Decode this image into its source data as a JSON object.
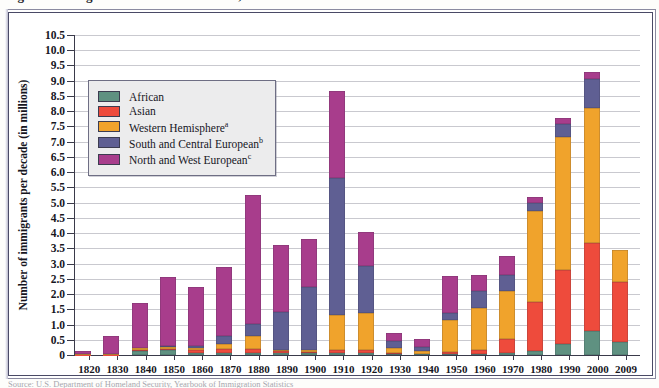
{
  "figure": {
    "caption_cut": "Figure 1  Immigration to the United States, 1820–2009",
    "footnote_cut": "Source: U.S. Department of Homeland Security, Yearbook of Immigration Statistics"
  },
  "chart_data": {
    "type": "bar",
    "stacked": true,
    "title": "",
    "xlabel": "",
    "ylabel": "Number of immigrants per decade (in millions)",
    "ylim": [
      0,
      10.5
    ],
    "ytick_step": 0.5,
    "ytick_labels": [
      "0",
      "0.5",
      "1.0",
      "1.5",
      "2.0",
      "2.5",
      "3.0",
      "3.5",
      "4.0",
      "4.5",
      "5.0",
      "5.5",
      "6.0",
      "6.5",
      "7.0",
      "7.5",
      "8.0",
      "8.5",
      "9.0",
      "9.5",
      "10.0",
      "10.5"
    ],
    "grid": true,
    "legend_position": "upper-left-inside",
    "categories": [
      "1820",
      "1830",
      "1840",
      "1850",
      "1860",
      "1870",
      "1880",
      "1890",
      "1900",
      "1910",
      "1920",
      "1930",
      "1940",
      "1950",
      "1960",
      "1970",
      "1980",
      "1990",
      "2000",
      "2009"
    ],
    "series": [
      {
        "name": "African",
        "color": "#5f9181",
        "values": [
          0.0,
          0.0,
          0.13,
          0.15,
          0.08,
          0.07,
          0.06,
          0.05,
          0.05,
          0.05,
          0.05,
          0.02,
          0.02,
          0.03,
          0.04,
          0.08,
          0.14,
          0.36,
          0.8,
          0.42
        ]
      },
      {
        "name": "Asian",
        "color": "#ee4b3c",
        "values": [
          0.01,
          0.01,
          0.02,
          0.04,
          0.07,
          0.12,
          0.13,
          0.07,
          0.06,
          0.11,
          0.11,
          0.03,
          0.02,
          0.06,
          0.14,
          0.43,
          1.59,
          2.44,
          2.86,
          1.99
        ]
      },
      {
        "name": "Western Hemisphere",
        "color": "#f0a32c",
        "values": [
          0.01,
          0.01,
          0.07,
          0.07,
          0.08,
          0.17,
          0.42,
          0.04,
          0.04,
          1.14,
          1.22,
          0.19,
          0.09,
          1.06,
          1.35,
          1.58,
          2.98,
          4.37,
          4.44,
          1.03
        ]
      },
      {
        "name": "South and Central European",
        "color": "#5f5f93",
        "values": [
          0.0,
          0.01,
          0.02,
          0.05,
          0.08,
          0.25,
          0.4,
          1.25,
          2.08,
          4.5,
          1.55,
          0.22,
          0.12,
          0.22,
          0.57,
          0.53,
          0.29,
          0.4,
          0.97,
          0.0
        ]
      },
      {
        "name": "North and West European",
        "color": "#a83d8c",
        "values": [
          0.1,
          0.58,
          1.48,
          2.24,
          1.92,
          2.29,
          4.23,
          2.19,
          1.58,
          2.88,
          1.12,
          0.25,
          0.28,
          1.23,
          0.54,
          0.63,
          0.19,
          0.22,
          0.21,
          0.0
        ]
      }
    ],
    "totals": [
      "0.13",
      "0.61",
      "1.71",
      "2.55",
      "2.21",
      "2.89",
      "5.25",
      "3.61",
      "8.80",
      "5.74",
      "4.11",
      "0.53",
      "1.03",
      "2.60",
      "3.21",
      "4.25",
      "7.34",
      "9.08",
      "10.30",
      "3.44"
    ],
    "legend_entries": [
      {
        "label": "African",
        "superscript": "",
        "color": "#5f9181"
      },
      {
        "label": "Asian",
        "superscript": "",
        "color": "#ee4b3c"
      },
      {
        "label": "Western Hemisphere",
        "superscript": "a",
        "color": "#f0a32c"
      },
      {
        "label": "South and Central European",
        "superscript": "b",
        "color": "#5f5f93"
      },
      {
        "label": "North and West European",
        "superscript": "c",
        "color": "#a83d8c"
      }
    ]
  }
}
